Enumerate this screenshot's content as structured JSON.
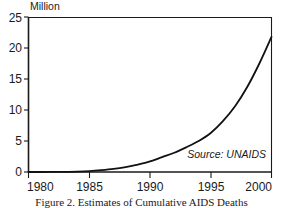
{
  "figure": {
    "caption": "Figure 2.  Estimates of Cumulative AIDS Deaths",
    "source_note": "Source: UNAIDS",
    "y_axis_unit_label": "Million"
  },
  "chart_data": {
    "type": "line",
    "title": "",
    "subtitle": "",
    "xlabel": "",
    "ylabel": "Million",
    "xlim": [
      1980,
      2000
    ],
    "ylim": [
      0,
      25
    ],
    "grid": false,
    "legend": false,
    "annotations": [
      {
        "text": "Source: UNAIDS",
        "x": 1996.2,
        "y": 3.2,
        "style": "italic"
      }
    ],
    "x_ticks": [
      1980,
      1985,
      1990,
      1995,
      2000
    ],
    "x_tick_labels": [
      "1980",
      "1985",
      "1990",
      "1995",
      "2000"
    ],
    "y_ticks": [
      0,
      5,
      10,
      15,
      20,
      25
    ],
    "y_tick_labels": [
      "0",
      "5",
      "10",
      "15",
      "20",
      "25"
    ],
    "series": [
      {
        "name": "Cumulative AIDS Deaths",
        "color": "#111111",
        "x": [
          1980,
          1981,
          1982,
          1983,
          1984,
          1985,
          1986,
          1987,
          1988,
          1989,
          1990,
          1991,
          1992,
          1993,
          1994,
          1995,
          1996,
          1997,
          1998,
          1999,
          2000
        ],
        "values": [
          0.0,
          0.0,
          0.01,
          0.03,
          0.07,
          0.15,
          0.3,
          0.5,
          0.8,
          1.2,
          1.7,
          2.4,
          3.1,
          4.0,
          5.0,
          6.3,
          8.2,
          10.6,
          13.7,
          17.5,
          21.8
        ]
      }
    ]
  }
}
